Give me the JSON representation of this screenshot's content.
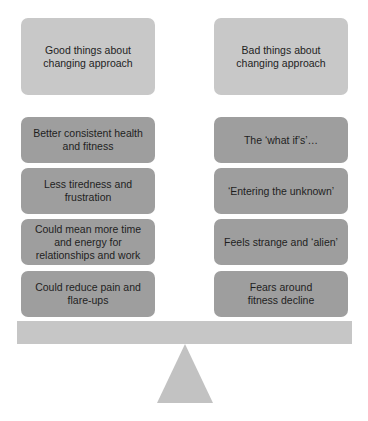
{
  "diagram": {
    "type": "balance-scale",
    "left": {
      "header": "Good things about changing approach",
      "items": [
        "Better consistent health and fitness",
        "Less tiredness and frustration",
        "Could mean more time and energy for relationships and work",
        "Could reduce pain and flare-ups"
      ]
    },
    "right": {
      "header": "Bad things about changing approach",
      "items": [
        "The ‘what if’s’…",
        "‘Entering the unknown’",
        "Feels strange and ‘alien’",
        "Fears around fitness decline"
      ]
    },
    "colors": {
      "header_fill": "#c8c8c8",
      "item_fill": "#9e9e9e",
      "beam_fill": "#c6c6c6",
      "fulcrum_fill": "#c2c2c2",
      "text": "#1e1e1e"
    }
  }
}
